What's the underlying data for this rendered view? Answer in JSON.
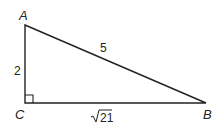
{
  "diagram": {
    "type": "right-triangle",
    "vertices": {
      "A": {
        "label": "A",
        "x": 25,
        "y": 25
      },
      "B": {
        "label": "B",
        "x": 206,
        "y": 103
      },
      "C": {
        "label": "C",
        "x": 25,
        "y": 103
      }
    },
    "right_angle_at": "C",
    "sides": {
      "AC": {
        "label": "2"
      },
      "AB": {
        "label": "5"
      },
      "CB": {
        "label": "21",
        "radical": true
      }
    },
    "colors": {
      "stroke": "#222222",
      "background": "#ffffff"
    }
  }
}
